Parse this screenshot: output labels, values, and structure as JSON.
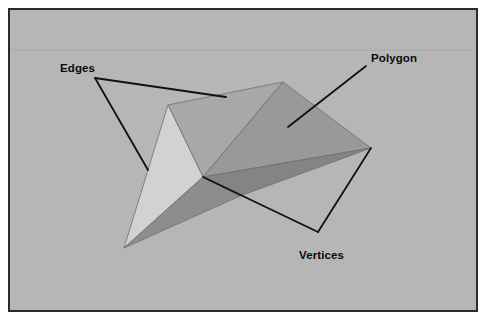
{
  "figure": {
    "background_color": "#b6b6b6",
    "frame_border_color": "#2b2b2b",
    "page_color": "#ffffff",
    "band_line_color": "#aaaaaa"
  },
  "labels": {
    "edges": "Edges",
    "polygon": "Polygon",
    "vertices": "Vertices"
  },
  "label_positions": {
    "edges": {
      "x": 60,
      "y": 72
    },
    "polygon": {
      "x": 371,
      "y": 62
    },
    "vertices": {
      "x": 299,
      "y": 259
    }
  },
  "leader_lines": {
    "color": "#111111",
    "width": 1.8,
    "edges": [
      {
        "name": "edges-to-top-edge",
        "points": "95,78 226,97"
      },
      {
        "name": "edges-to-left-edge",
        "points": "95,78 148,170"
      }
    ],
    "polygon": [
      {
        "name": "polygon-to-face",
        "points": "366,66 288,127"
      }
    ],
    "vertices": [
      {
        "name": "vertices-to-center-vertex",
        "points": "318,232 203,177"
      },
      {
        "name": "vertices-to-right-vertex",
        "points": "318,232 371,148"
      }
    ]
  },
  "polyhedron": {
    "name": "octahedron-like-polygon-mesh",
    "outline_color": "#6f6f6f",
    "vertices": {
      "top_apex": {
        "x": 283,
        "y": 82
      },
      "left_upper": {
        "x": 168,
        "y": 105
      },
      "right": {
        "x": 371,
        "y": 148
      },
      "center": {
        "x": 203,
        "y": 177
      },
      "bottom_left": {
        "x": 124,
        "y": 248
      },
      "lower_mid": {
        "x": 240,
        "y": 196
      }
    },
    "faces": [
      {
        "name": "face-top-left-quad",
        "points": "168,105 283,82 203,177",
        "fill": "#a8a8a8"
      },
      {
        "name": "face-left-light-triangle",
        "points": "168,105 203,177 124,248",
        "fill": "#d2d2d2"
      },
      {
        "name": "face-left-lower-dark",
        "points": "124,248 203,177 240,196",
        "fill": "#8d8d8d"
      },
      {
        "name": "face-right-upper-large",
        "points": "283,82 371,148 203,177",
        "fill": "#999999"
      },
      {
        "name": "face-right-lower-dark",
        "points": "203,177 371,148 240,196",
        "fill": "#848484"
      }
    ]
  }
}
